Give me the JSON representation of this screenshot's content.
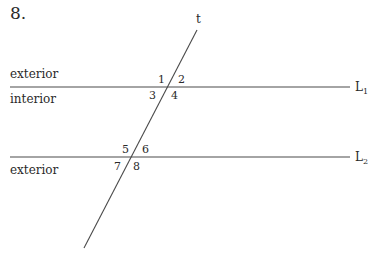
{
  "problem_number": "8.",
  "transversal": {
    "label": "t",
    "start": [
      197,
      30
    ],
    "end": [
      84,
      248
    ]
  },
  "lines": [
    {
      "name": "L",
      "sub": "1",
      "y": 87,
      "x1": 10,
      "x2": 350
    },
    {
      "name": "L",
      "sub": "2",
      "y": 157,
      "x1": 10,
      "x2": 350
    }
  ],
  "region_labels": {
    "top_exterior": "exterior",
    "interior": "interior",
    "bottom_exterior": "exterior"
  },
  "angles": [
    "1",
    "2",
    "3",
    "4",
    "5",
    "6",
    "7",
    "8"
  ],
  "colors": {
    "line": "#4a4a4a",
    "text": "#2a2a2a"
  }
}
